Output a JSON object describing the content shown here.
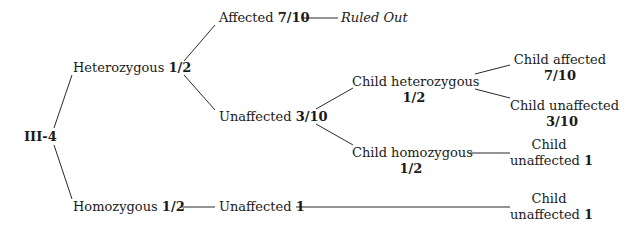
{
  "diagram": {
    "type": "probability-tree",
    "root": {
      "label": "III-4"
    },
    "nodes": {
      "heterozygous": {
        "label": "Heterozygous",
        "prob": "1/2"
      },
      "homozygous": {
        "label": "Homozygous",
        "prob": "1/2"
      },
      "affected": {
        "label": "Affected",
        "prob": "7/10"
      },
      "ruled_out": {
        "label": "Ruled Out"
      },
      "unaffected": {
        "label": "Unaffected",
        "prob": "3/10"
      },
      "hom_unaffected": {
        "label": "Unaffected",
        "prob": "1"
      },
      "child_het": {
        "label": "Child heterozygous",
        "prob": "1/2"
      },
      "child_hom": {
        "label": "Child homozygous",
        "prob": "1/2"
      },
      "child_affected": {
        "label": "Child affected",
        "prob": "7/10"
      },
      "child_unaffected_het": {
        "label": "Child unaffected",
        "prob": "3/10"
      },
      "child_unaffected_hom_line1": "Child",
      "child_unaffected_hom_line2": "unaffected",
      "child_unaffected_hom_prob": "1",
      "child_unaffected_final_line1": "Child",
      "child_unaffected_final_line2": "unaffected",
      "child_unaffected_final_prob": "1"
    },
    "edges": [
      [
        "III-4",
        "Heterozygous 1/2"
      ],
      [
        "III-4",
        "Homozygous 1/2"
      ],
      [
        "Heterozygous 1/2",
        "Affected 7/10"
      ],
      [
        "Heterozygous 1/2",
        "Unaffected 3/10"
      ],
      [
        "Affected 7/10",
        "Ruled Out"
      ],
      [
        "Unaffected 3/10",
        "Child heterozygous 1/2"
      ],
      [
        "Unaffected 3/10",
        "Child homozygous 1/2"
      ],
      [
        "Child heterozygous 1/2",
        "Child affected 7/10"
      ],
      [
        "Child heterozygous 1/2",
        "Child unaffected 3/10"
      ],
      [
        "Child homozygous 1/2",
        "Child unaffected 1"
      ],
      [
        "Homozygous 1/2",
        "Unaffected 1"
      ],
      [
        "Unaffected 1",
        "Child unaffected 1"
      ]
    ]
  }
}
